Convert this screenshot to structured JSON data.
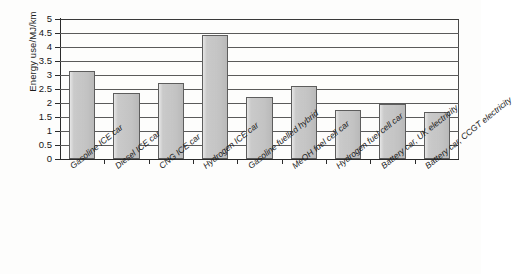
{
  "chart_data": {
    "type": "bar",
    "title": "",
    "xlabel": "",
    "ylabel": "Energy use/MJ/km",
    "ylim": [
      0,
      5
    ],
    "ytick_labels": [
      "5",
      "4.5",
      "4",
      "3.5",
      "3",
      "2.5",
      "2",
      "1.5",
      "1",
      "0.5",
      "0"
    ],
    "ytick_values": [
      5,
      4.5,
      4,
      3.5,
      3,
      2.5,
      2,
      1.5,
      1,
      0.5,
      0
    ],
    "grid": "horizontal",
    "legend": "none",
    "bar_color": "#c7c7c7",
    "bar_edge_color": "#5d5d5d",
    "axis_color": "#2b2b2b",
    "categories": [
      "Gasoline ICE car",
      "Diesel ICE car",
      "CNG ICE car",
      "Hydrogen ICE car",
      "Gasoline fuelled hybrid",
      "MeOH fuel cell car",
      "Hydrogen fuel cell car",
      "Battery car, UK electricity",
      "Battery car, CCGT electricity"
    ],
    "values": [
      3.15,
      2.35,
      2.72,
      4.42,
      2.2,
      2.6,
      1.75,
      1.97,
      1.68
    ]
  }
}
